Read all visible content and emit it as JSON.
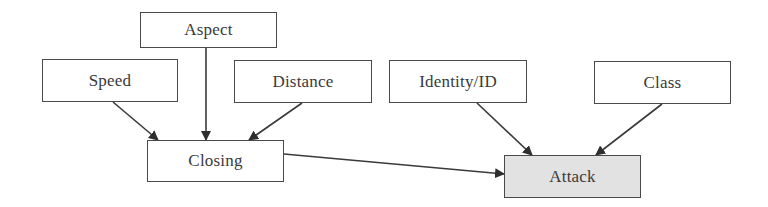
{
  "diagram": {
    "type": "flow",
    "nodes": [
      {
        "id": "aspect",
        "label": "Aspect"
      },
      {
        "id": "speed",
        "label": "Speed"
      },
      {
        "id": "distance",
        "label": "Distance"
      },
      {
        "id": "closing",
        "label": "Closing"
      },
      {
        "id": "identity",
        "label": "Identity/ID"
      },
      {
        "id": "class",
        "label": "Class"
      },
      {
        "id": "attack",
        "label": "Attack",
        "highlighted": true
      }
    ],
    "edges": [
      {
        "from": "speed",
        "to": "closing"
      },
      {
        "from": "aspect",
        "to": "closing"
      },
      {
        "from": "distance",
        "to": "closing"
      },
      {
        "from": "closing",
        "to": "attack"
      },
      {
        "from": "identity",
        "to": "attack"
      },
      {
        "from": "class",
        "to": "attack"
      }
    ],
    "colors": {
      "stroke": "#3a3a3a",
      "text": "#3a3a3a",
      "highlight_fill": "#e2e2e2",
      "node_fill": "#ffffff"
    }
  }
}
